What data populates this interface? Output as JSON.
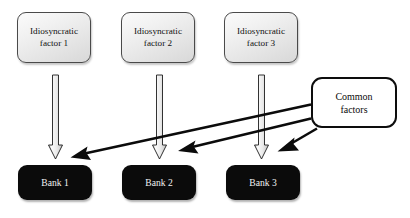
{
  "diagram": {
    "background_color": "#ffffff",
    "factor_boxes": [
      {
        "line1": "Idiosyncratic",
        "line2": "factor 1",
        "fill": "#ededed",
        "border": "#4a4a4a"
      },
      {
        "line1": "Idiosyncratic",
        "line2": "factor 2",
        "fill": "#ededed",
        "border": "#4a4a4a"
      },
      {
        "line1": "Idiosyncratic",
        "line2": "factor 3",
        "fill": "#ededed",
        "border": "#4a4a4a"
      }
    ],
    "common_box": {
      "line1": "Common",
      "line2": "factors",
      "fill": "#ffffff",
      "border": "#0d0d0d"
    },
    "bank_boxes": [
      {
        "label": "Bank 1",
        "fill": "#0b0b0b",
        "text_color": "#f2f2f2"
      },
      {
        "label": "Bank 2",
        "fill": "#0b0b0b",
        "text_color": "#f2f2f2"
      },
      {
        "label": "Bank 3",
        "fill": "#0b0b0b",
        "text_color": "#f2f2f2"
      }
    ],
    "block_arrows": [
      {
        "name": "factor-1-to-bank-1",
        "direction": "down",
        "fill": "#e8e8e8",
        "stroke": "#1a1a1a"
      },
      {
        "name": "factor-2-to-bank-2",
        "direction": "down",
        "fill": "#e8e8e8",
        "stroke": "#1a1a1a"
      },
      {
        "name": "factor-3-to-bank-3",
        "direction": "down",
        "fill": "#e8e8e8",
        "stroke": "#1a1a1a"
      }
    ],
    "common_arrows": [
      {
        "name": "common-to-bank-1",
        "direction": "down-left",
        "color": "#0b0b0b"
      },
      {
        "name": "common-to-bank-2",
        "direction": "down-left",
        "color": "#0b0b0b"
      },
      {
        "name": "common-to-bank-3",
        "direction": "down-left",
        "color": "#0b0b0b"
      }
    ]
  }
}
